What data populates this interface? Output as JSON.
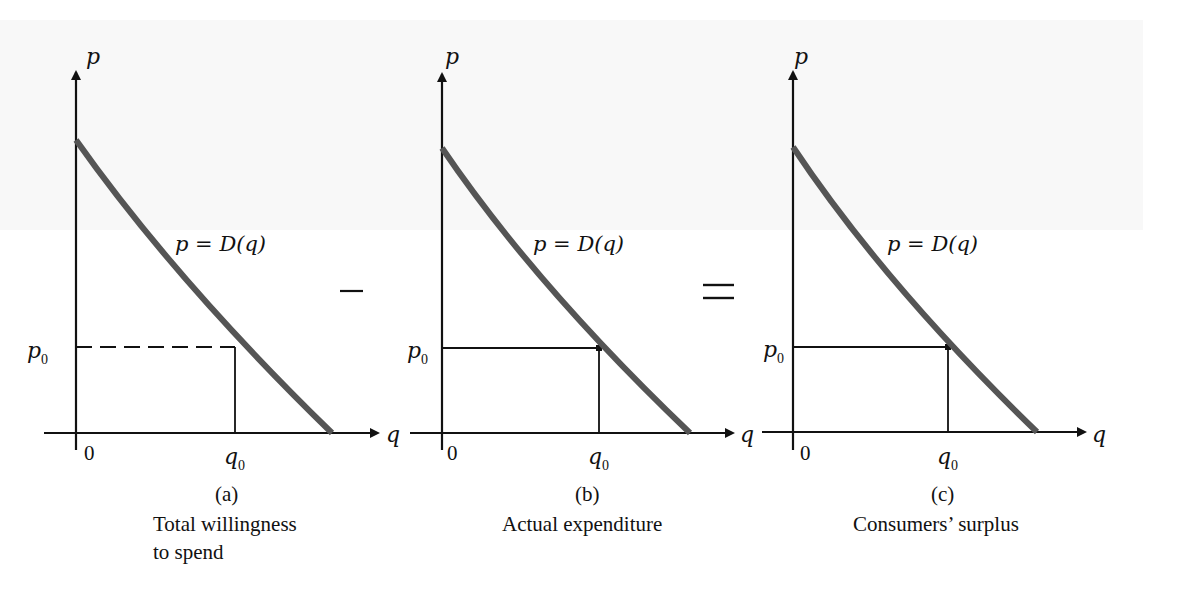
{
  "figure": {
    "operators": [
      "−",
      "="
    ],
    "panels": [
      {
        "id": "a",
        "label": "(a)",
        "caption_lines": [
          "Total willingness",
          "to spend"
        ],
        "y_axis_label": "p",
        "x_axis_label": "q",
        "origin_label": "0",
        "p0_label": "p",
        "p0_sub": "0",
        "q0_label": "q",
        "q0_sub": "0",
        "curve_label": "p = D(q)",
        "guide_style": "dashed"
      },
      {
        "id": "b",
        "label": "(b)",
        "caption_lines": [
          "Actual expenditure"
        ],
        "y_axis_label": "p",
        "x_axis_label": "q",
        "origin_label": "0",
        "p0_label": "p",
        "p0_sub": "0",
        "q0_label": "q",
        "q0_sub": "0",
        "curve_label": "p = D(q)",
        "guide_style": "solid"
      },
      {
        "id": "c",
        "label": "(c)",
        "caption_lines": [
          "Consumers’ surplus"
        ],
        "y_axis_label": "p",
        "x_axis_label": "q",
        "origin_label": "0",
        "p0_label": "p",
        "p0_sub": "0",
        "q0_label": "q",
        "q0_sub": "0",
        "curve_label": "p = D(q)",
        "guide_style": "solid"
      }
    ],
    "colors": {
      "curve": "#555555",
      "axis": "#111111",
      "text": "#111111"
    }
  }
}
